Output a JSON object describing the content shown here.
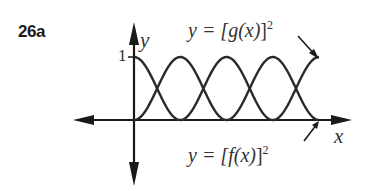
{
  "problem_number": "26a",
  "chart_data": {
    "type": "line",
    "title": "",
    "xlabel": "x",
    "ylabel": "y",
    "y_ticks": [
      "1"
    ],
    "ylim": [
      0,
      1
    ],
    "xlim": [
      0,
      6.28
    ],
    "series": [
      {
        "name": "y = [g(x)]²",
        "function": "sin²(x)",
        "start_value": 0,
        "points": [
          [
            0,
            0
          ],
          [
            0.785,
            0.5
          ],
          [
            1.571,
            1
          ],
          [
            2.356,
            0.5
          ],
          [
            3.142,
            0
          ],
          [
            3.927,
            0.5
          ],
          [
            4.712,
            1
          ],
          [
            5.498,
            0.5
          ],
          [
            6.283,
            0
          ]
        ]
      },
      {
        "name": "y = [f(x)]²",
        "function": "cos²(x)",
        "start_value": 1,
        "points": [
          [
            0,
            1
          ],
          [
            0.785,
            0.5
          ],
          [
            1.571,
            0
          ],
          [
            2.356,
            0.5
          ],
          [
            3.142,
            1
          ],
          [
            3.927,
            0.5
          ],
          [
            4.712,
            0
          ],
          [
            5.498,
            0.5
          ],
          [
            6.283,
            1
          ]
        ]
      }
    ],
    "annotations": [
      {
        "text": "y = [g(x)]²",
        "points_to": "upper right curve end"
      },
      {
        "text": "y = [f(x)]²",
        "points_to": "lower right curve end"
      }
    ],
    "grid": false,
    "legend": "none (arrow annotations)"
  },
  "labels": {
    "y_axis": "y",
    "x_axis": "x",
    "one_tick": "1",
    "g_label_prefix": "y = [",
    "g_name": "g",
    "g_arg": "(x)",
    "g_suffix": "]",
    "f_label_prefix": "y = [",
    "f_name": "f",
    "f_arg": "(x)",
    "f_suffix": "]",
    "power": "2"
  },
  "colors": {
    "ink": "#1a1a1a",
    "background": "#ffffff"
  }
}
